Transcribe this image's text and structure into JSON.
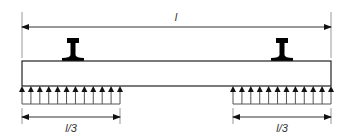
{
  "diagram": {
    "colors": {
      "line": "#222222",
      "extension": "#999999",
      "rail": "#000000",
      "label": "#333333"
    },
    "span_label": "l",
    "left_support_label": "l/3",
    "right_support_label": "l/3",
    "rails": [
      {
        "name": "left-rail",
        "center_x": 73
      },
      {
        "name": "right-rail",
        "center_x": 282
      }
    ],
    "support_arrows": {
      "left_count": 12,
      "right_count": 12
    }
  }
}
